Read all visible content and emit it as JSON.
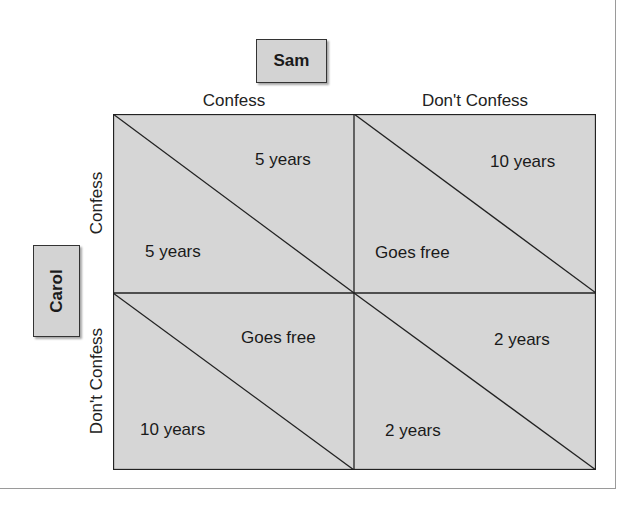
{
  "header": {
    "cut_text": "ing game theory"
  },
  "players": {
    "column": {
      "name": "Sam",
      "strategies": [
        "Confess",
        "Don't Confess"
      ]
    },
    "row": {
      "name": "Carol",
      "strategies": [
        "Confess",
        "Don't Confess"
      ]
    }
  },
  "cells": [
    {
      "row": "Confess",
      "col": "Confess",
      "sam": "5 years",
      "carol": "5 years"
    },
    {
      "row": "Confess",
      "col": "Don't Confess",
      "sam": "10 years",
      "carol": "Goes free"
    },
    {
      "row": "Don't Confess",
      "col": "Confess",
      "sam": "Goes free",
      "carol": "10 years"
    },
    {
      "row": "Don't Confess",
      "col": "Don't Confess",
      "sam": "2 years",
      "carol": "2 years"
    }
  ],
  "colors": {
    "cell_fill": "#d6d6d6",
    "box_fill": "#d3d3d3",
    "line": "#222222"
  }
}
